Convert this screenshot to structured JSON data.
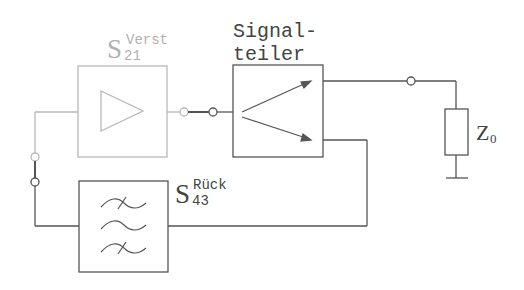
{
  "diagram": {
    "title": "",
    "colors": {
      "wire_dark": "#555555",
      "wire_faded": "#b8b8b8",
      "text_dark": "#444444",
      "text_faded": "#b0b0b0"
    },
    "amplifier": {
      "symbol": "S",
      "subscript": "21",
      "superscript": "Verst",
      "icon": "amplifier-triangle-icon"
    },
    "splitter": {
      "label_line1": "Signal-",
      "label_line2": "teiler",
      "icon": "signal-splitter-arrows-icon"
    },
    "feedback_filter": {
      "symbol": "S",
      "subscript": "43",
      "superscript": "Rück",
      "icon": "bandpass-filter-icon"
    },
    "load": {
      "symbol": "Z",
      "subscript": "0",
      "icon": "resistor-icon"
    },
    "ground": {
      "icon": "ground-icon"
    }
  }
}
